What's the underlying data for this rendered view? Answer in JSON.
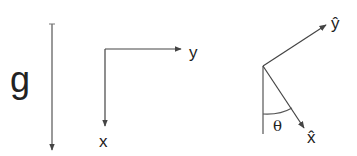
{
  "gravity": {
    "label": "g"
  },
  "axes_fixed": {
    "x_label": "x",
    "y_label": "y"
  },
  "axes_rotated": {
    "x_label": "x̂",
    "y_label": "ŷ",
    "angle_label": "θ"
  },
  "colors": {
    "stroke": "#444444",
    "text": "#222222"
  }
}
